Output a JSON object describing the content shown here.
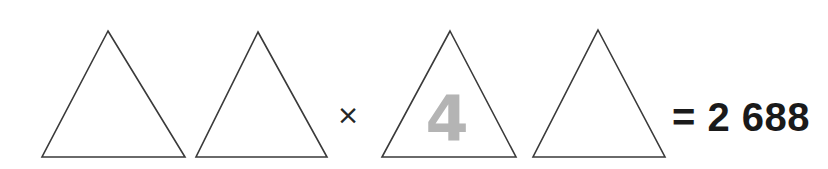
{
  "canvas": {
    "width": 828,
    "height": 169,
    "background_color": "#ffffff"
  },
  "puzzle": {
    "type": "rebus-math-puzzle",
    "expression_text": "△ △ × △(4) △ = 2 688",
    "shape_outline_color": "#3a3a3a",
    "handwriting_color": "#b4b4b4",
    "text_color": "#1a1a1a"
  },
  "shapes": [
    {
      "name": "triangle-1",
      "label": "",
      "apex_x": 108,
      "apex_y": 31,
      "base_left_x": 42,
      "base_right_x": 185,
      "base_y": 157
    },
    {
      "name": "triangle-2",
      "label": "",
      "apex_x": 258,
      "apex_y": 32,
      "base_left_x": 196,
      "base_right_x": 327,
      "base_y": 157
    },
    {
      "name": "triangle-3",
      "label": "4",
      "apex_x": 450,
      "apex_y": 31,
      "base_left_x": 382,
      "base_right_x": 516,
      "base_y": 157
    },
    {
      "name": "triangle-4",
      "label": "",
      "apex_x": 598,
      "apex_y": 30,
      "base_left_x": 533,
      "base_right_x": 665,
      "base_y": 157
    }
  ],
  "operators": [
    {
      "name": "multiplication-sign",
      "symbol": "×",
      "x": 348,
      "y": 116
    }
  ],
  "result": {
    "equals_sign": "=",
    "value": "2 688",
    "full_text": "= 2 688",
    "x": 672,
    "y": 120
  }
}
